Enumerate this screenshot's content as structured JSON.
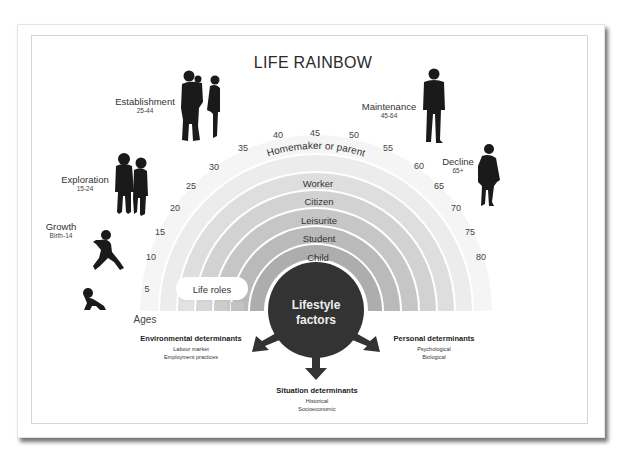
{
  "title": "LIFE RAINBOW",
  "stages": [
    {
      "name": "Growth",
      "range": "Birth-14"
    },
    {
      "name": "Exploration",
      "range": "15-24"
    },
    {
      "name": "Establishment",
      "range": "25-44"
    },
    {
      "name": "Maintenance",
      "range": "45-64"
    },
    {
      "name": "Decline",
      "range": "65+"
    }
  ],
  "ages_label": "Ages",
  "ages": [
    "5",
    "10",
    "15",
    "20",
    "25",
    "30",
    "35",
    "40",
    "45",
    "50",
    "55",
    "60",
    "65",
    "70",
    "75",
    "80"
  ],
  "life_roles_label": "Life roles",
  "roles": [
    "Homemaker or parent",
    "Worker",
    "Citizen",
    "Leisurite",
    "Student",
    "Child"
  ],
  "center": {
    "line1": "Lifestyle",
    "line2": "factors"
  },
  "determinants": {
    "environmental": {
      "title": "Environmental determinants",
      "items": [
        "Labour market",
        "Employment practices"
      ]
    },
    "personal": {
      "title": "Personal determinants",
      "items": [
        "Psychological",
        "Biological"
      ]
    },
    "situation": {
      "title": "Situation determinants",
      "items": [
        "Historical",
        "Socioeconomic"
      ]
    }
  },
  "colors": {
    "circle": "#333333",
    "band_inner": "#a9a9a9",
    "band_outer": "#ececec",
    "silhouette": "#1a1a1a"
  }
}
